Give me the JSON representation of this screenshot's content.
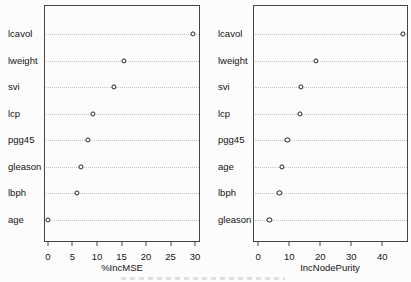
{
  "figure": {
    "background_color": "#fcfcfc",
    "box_border_color": "#454545",
    "gridline_color": "#c4c4c4",
    "point_outline_color": "#222222",
    "point_fill_color": "#ffffff",
    "text_color": "#141414"
  },
  "chart_data": [
    {
      "type": "scatter",
      "style": "dot-chart",
      "title": "",
      "xlabel": "%IncMSE",
      "ylabel": "",
      "categories": [
        "lcavol",
        "lweight",
        "svi",
        "lcp",
        "pgg45",
        "gleason",
        "lbph",
        "age"
      ],
      "values": [
        29.5,
        15.5,
        13.5,
        9.2,
        8.1,
        6.7,
        5.9,
        0.0
      ],
      "xticks": [
        0,
        5,
        10,
        15,
        20,
        25,
        30
      ],
      "xlim": [
        -0.8,
        31.0
      ],
      "grid": "horizontal dotted",
      "legend": "none",
      "marker": "open-circle"
    },
    {
      "type": "scatter",
      "style": "dot-chart",
      "title": "",
      "xlabel": "IncNodePurity",
      "ylabel": "",
      "categories": [
        "lcavol",
        "lweight",
        "svi",
        "lcp",
        "pgg45",
        "age",
        "lbph",
        "gleason"
      ],
      "values": [
        46.6,
        18.7,
        13.7,
        13.5,
        9.4,
        7.7,
        6.8,
        3.6
      ],
      "xticks": [
        0,
        10,
        20,
        30,
        40
      ],
      "xlim": [
        -1.7,
        48.3
      ],
      "grid": "horizontal dotted",
      "legend": "none",
      "marker": "open-circle"
    }
  ]
}
